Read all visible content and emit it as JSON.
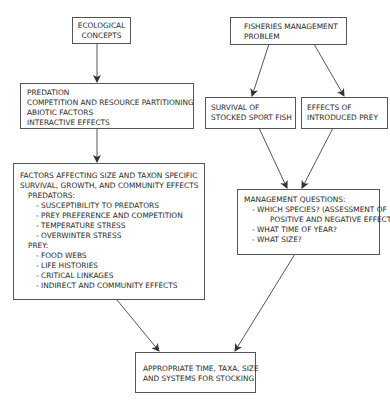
{
  "diagram": {
    "nodes": {
      "ecological_concepts": {
        "lines": [
          "ECOLOGICAL",
          "CONCEPTS"
        ]
      },
      "ecological_principles": {
        "lines": [
          "PREDATION",
          "COMPETITION AND RESOURCE PARTITIONING",
          "ABIOTIC FACTORS",
          "INTERACTIVE EFFECTS"
        ]
      },
      "factors": {
        "title_lines": [
          "FACTORS AFFECTING SIZE AND TAXON SPECIFIC",
          "SURVIVAL, GROWTH, AND COMMUNITY EFFECTS"
        ],
        "predators_label": "PREDATORS:",
        "predators_items": [
          "- SUSCEPTIBILITY TO PREDATORS",
          "- PREY PREFERENCE AND COMPETITION",
          "- TEMPERATURE STRESS",
          "- OVERWINTER STRESS"
        ],
        "prey_label": "PREY:",
        "prey_items": [
          "- FOOD WEBS",
          "- LIFE HISTORIES",
          "- CRITICAL LINKAGES",
          "- INDIRECT  AND COMMUNITY EFFECTS"
        ]
      },
      "fisheries_problem": {
        "lines": [
          "FISHERIES MANAGEMENT",
          "PROBLEM"
        ]
      },
      "survival_stocked": {
        "lines": [
          "SURVIVAL OF",
          "STOCKED SPORT FISH"
        ]
      },
      "effects_prey": {
        "lines": [
          "EFFECTS OF",
          "INTRODUCED PREY"
        ]
      },
      "management_questions": {
        "title": "MANAGEMENT QUESTIONS:",
        "items": [
          "- WHICH SPECIES? (ASSESSMENT OF",
          "POSITIVE AND NEGATIVE EFFECTS)",
          "- WHAT TIME OF YEAR?",
          "- WHAT SIZE?"
        ]
      },
      "appropriate_stocking": {
        "lines": [
          "APPROPRIATE TIME, TAXA, SIZE",
          "AND SYSTEMS FOR STOCKING"
        ]
      }
    },
    "edges": [
      {
        "from": "ecological_concepts",
        "to": "ecological_principles"
      },
      {
        "from": "ecological_principles",
        "to": "factors"
      },
      {
        "from": "fisheries_problem",
        "to": "survival_stocked"
      },
      {
        "from": "fisheries_problem",
        "to": "effects_prey"
      },
      {
        "from": "survival_stocked",
        "to": "management_questions"
      },
      {
        "from": "effects_prey",
        "to": "management_questions"
      },
      {
        "from": "factors",
        "to": "appropriate_stocking"
      },
      {
        "from": "management_questions",
        "to": "appropriate_stocking"
      }
    ],
    "colors": {
      "line": "#555555",
      "text": "#2a2a2a",
      "background": "#ffffff"
    }
  }
}
